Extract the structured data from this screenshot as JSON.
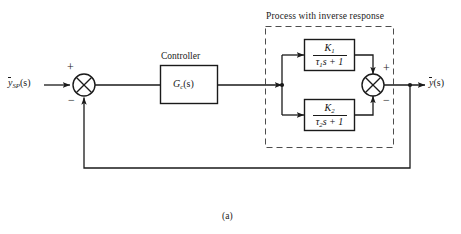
{
  "figure": {
    "caption": "(a)",
    "type": "block-diagram"
  },
  "labels": {
    "setpoint": {
      "base": "y",
      "sub": "SP",
      "arg": "(s)",
      "overbar": true
    },
    "output": {
      "base": "y",
      "sub": "",
      "arg": "(s)",
      "overbar": true
    }
  },
  "blocks": {
    "controller": {
      "title": "Controller",
      "body_base": "G",
      "body_sub": "c",
      "body_arg": "(s)"
    },
    "process_group": {
      "title": "Process with inverse response",
      "boxed": "dashed"
    },
    "path_upper": {
      "numerator_base": "K",
      "numerator_sub": "1",
      "denominator_tau": "τ",
      "denominator_sub": "1",
      "denominator_rest": "s + 1"
    },
    "path_lower": {
      "numerator_base": "K",
      "numerator_sub": "2",
      "denominator_tau": "τ",
      "denominator_sub": "2",
      "denominator_rest": "s + 1"
    }
  },
  "summing_junctions": [
    {
      "id": "error-junction",
      "sign_top": "+",
      "sign_bottom": "−"
    },
    {
      "id": "process-junction",
      "sign_top": "+",
      "sign_bottom": "−"
    }
  ],
  "colors": {
    "line": "#1a1a1a",
    "dashed": "#555555",
    "text": "#1a1a1a",
    "background": "#ffffff"
  }
}
